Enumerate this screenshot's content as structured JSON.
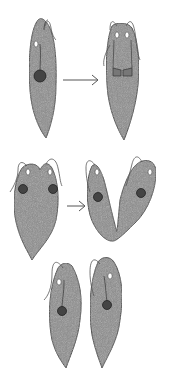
{
  "diagram": {
    "stages": [
      {
        "id": "stage-1",
        "label": "single cell with nucleus"
      },
      {
        "id": "stage-2",
        "label": "nucleus dividing, flagella doubled"
      },
      {
        "id": "stage-3",
        "label": "two nuclei, cell beginning to split at anterior"
      },
      {
        "id": "stage-4",
        "label": "longitudinal split progressing"
      },
      {
        "id": "stage-5",
        "label": "two daughter cells"
      }
    ],
    "arrows": [
      {
        "from": "stage-1",
        "to": "stage-2"
      },
      {
        "from": "stage-3",
        "to": "stage-4"
      }
    ],
    "colors": {
      "cell_fill": "#8c8c8c",
      "cell_outline": "#3a3a3a",
      "nucleus": "#333333",
      "arrow": "#555555",
      "flagellum": "#555555"
    }
  }
}
